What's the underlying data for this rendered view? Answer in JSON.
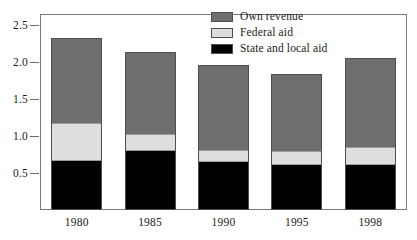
{
  "chart_data": {
    "type": "bar",
    "subtype": "stacked-bar",
    "title": "",
    "subtitle": "",
    "xlabel": "",
    "ylabel": "",
    "categories": [
      "1980",
      "1985",
      "1990",
      "1995",
      "1998"
    ],
    "ylim": [
      0,
      2.65
    ],
    "yticks": [
      0.5,
      1.0,
      1.5,
      2.0,
      2.5
    ],
    "ytick_labels": [
      "0.5",
      "1.0",
      "1.5",
      "2.0",
      "2.5"
    ],
    "grid": false,
    "legend_position": "top-center",
    "stack_order_bottom_to_top": [
      "State and local aid",
      "Federal aid",
      "Own revenue"
    ],
    "series": [
      {
        "name": "State and local aid",
        "color": "#000000",
        "values": [
          0.65,
          0.8,
          0.64,
          0.6,
          0.6
        ]
      },
      {
        "name": "Federal aid",
        "color": "#dedede",
        "values": [
          0.52,
          0.23,
          0.17,
          0.2,
          0.25
        ]
      },
      {
        "name": "Own revenue",
        "color": "#6e6e6e",
        "values": [
          1.15,
          1.1,
          1.15,
          1.04,
          1.2
        ]
      }
    ],
    "totals": [
      2.32,
      2.13,
      1.96,
      1.84,
      2.05
    ]
  },
  "legend": {
    "items": [
      {
        "label": "Own revenue",
        "color": "#6e6e6e"
      },
      {
        "label": "Federal aid",
        "color": "#dedede"
      },
      {
        "label": "State and local aid",
        "color": "#000000"
      }
    ]
  },
  "axes": {
    "y": {
      "tick_labels": [
        "2.5",
        "2.0",
        "1.5",
        "1.0",
        "0.5"
      ]
    },
    "x": {
      "tick_labels": [
        "1980",
        "1985",
        "1990",
        "1995",
        "1998"
      ]
    }
  }
}
